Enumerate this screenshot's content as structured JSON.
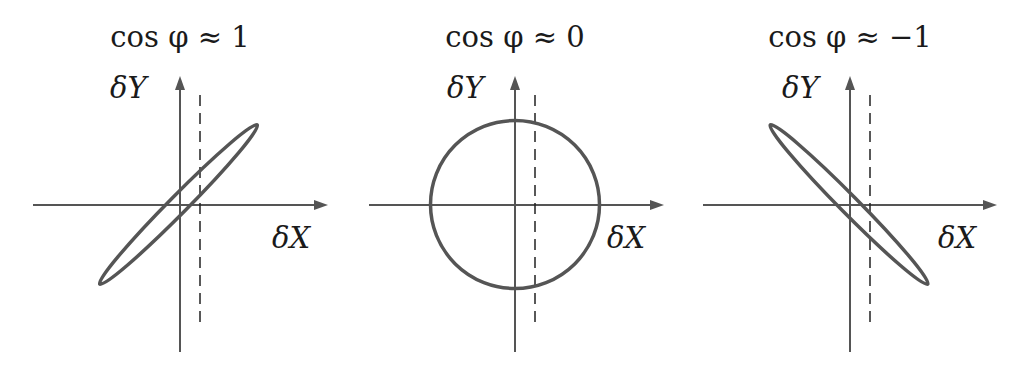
{
  "figure": {
    "panels": [
      {
        "title": "cos φ ≈ 1",
        "y_label": "δY",
        "x_label": "δX",
        "shape": "ellipse",
        "orientation": "positive-slope",
        "description": "narrow ellipse tilted along +45°"
      },
      {
        "title": "cos φ ≈ 0",
        "y_label": "δY",
        "x_label": "δX",
        "shape": "circle",
        "orientation": "none",
        "description": "circle centered at origin"
      },
      {
        "title": "cos φ ≈ −1",
        "y_label": "δY",
        "x_label": "δX",
        "shape": "ellipse",
        "orientation": "negative-slope",
        "description": "narrow ellipse tilted along −45°"
      }
    ],
    "colors": {
      "axis": "#555555",
      "curve": "#555555",
      "dashed_line": "#222222",
      "text": "#1a1a1a",
      "background": "#ffffff"
    }
  }
}
